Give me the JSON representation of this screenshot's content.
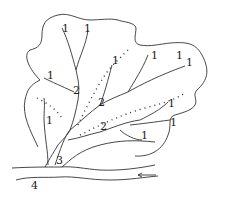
{
  "diagram": {
    "stroke_color": "#333333",
    "labels": [
      {
        "text": "1",
        "x": 62,
        "y": 23
      },
      {
        "text": "1",
        "x": 84,
        "y": 23
      },
      {
        "text": "1",
        "x": 151,
        "y": 50
      },
      {
        "text": "1",
        "x": 176,
        "y": 50
      },
      {
        "text": "1",
        "x": 186,
        "y": 57
      },
      {
        "text": "1",
        "x": 47,
        "y": 70
      },
      {
        "text": "1",
        "x": 112,
        "y": 55
      },
      {
        "text": "1",
        "x": 46,
        "y": 115
      },
      {
        "text": "1",
        "x": 168,
        "y": 98
      },
      {
        "text": "1",
        "x": 170,
        "y": 117
      },
      {
        "text": "1",
        "x": 141,
        "y": 130
      },
      {
        "text": "2",
        "x": 73,
        "y": 85
      },
      {
        "text": "2",
        "x": 98,
        "y": 97
      },
      {
        "text": "2",
        "x": 100,
        "y": 121
      },
      {
        "text": "3",
        "x": 56,
        "y": 155
      },
      {
        "text": "4",
        "x": 31,
        "y": 180
      }
    ],
    "flow_arrow": "left-arrow"
  }
}
